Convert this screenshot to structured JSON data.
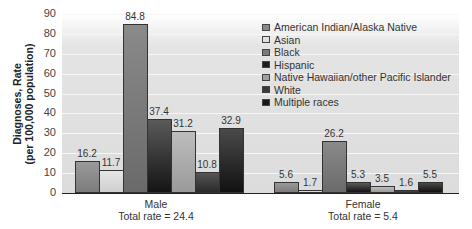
{
  "chart_data": {
    "type": "bar",
    "title": "",
    "xlabel": "",
    "ylabel": "Diagnoses, Rate (per 100,000 population)",
    "ylim": [
      0,
      90
    ],
    "yticks": [
      0,
      10,
      20,
      30,
      40,
      50,
      60,
      70,
      80,
      90
    ],
    "grid": true,
    "legend_position": "upper right",
    "categories": [
      "Male",
      "Female"
    ],
    "category_sublabels": [
      "Total rate = 24.4",
      "Total rate = 5.4"
    ],
    "series": [
      {
        "name": "American Indian/Alaska Native",
        "values": [
          16.2,
          5.6
        ],
        "color": "#8a8a8a"
      },
      {
        "name": "Asian",
        "values": [
          11.7,
          1.7
        ],
        "color": "#d8d8d8"
      },
      {
        "name": "Black",
        "values": [
          84.8,
          26.2
        ],
        "color": "#7a7a7a"
      },
      {
        "name": "Hispanic",
        "values": [
          37.4,
          5.3
        ],
        "color": "#2a2a2a"
      },
      {
        "name": "Native Hawaiian/other Pacific Islander",
        "values": [
          31.2,
          3.5
        ],
        "color": "#a8a8a8"
      },
      {
        "name": "White",
        "values": [
          10.8,
          1.6
        ],
        "color": "#3c3c3c"
      },
      {
        "name": "Multiple races",
        "values": [
          32.9,
          5.5
        ],
        "color": "#1e1e1e"
      }
    ]
  },
  "labels": {
    "ylabel_line1": "Diagnoses, Rate",
    "ylabel_line2": "(per 100,000 population)",
    "male": "Male",
    "male_total": "Total rate = 24.4",
    "female": "Female",
    "female_total": "Total rate = 5.4"
  }
}
